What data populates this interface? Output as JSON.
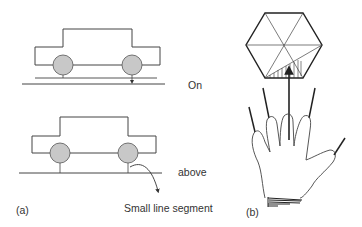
{
  "figure": {
    "panel_a": {
      "label": "(a)",
      "top_state_label": "On",
      "bottom_state_label": "above",
      "annotation": "Small line segment"
    },
    "panel_b": {
      "label": "(b)"
    }
  },
  "colors": {
    "stroke": "#333333",
    "wheel_fill": "#c8c8c8",
    "background": "#ffffff"
  }
}
